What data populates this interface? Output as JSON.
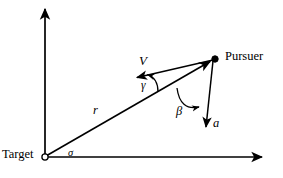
{
  "figure": {
    "background_color": "#ffffff",
    "stroke_color": "#000000",
    "width": 283,
    "height": 178
  },
  "labels": {
    "target": "Target",
    "pursuer": "Pursuer",
    "velocity": "V",
    "acceleration": "a",
    "range": "r",
    "gamma": "γ",
    "beta": "β",
    "sigma": "σ"
  },
  "diagram_data": {
    "type": "vector-diagram",
    "axes": {
      "origin": [
        45,
        157
      ],
      "x_axis_end": [
        265,
        157
      ],
      "y_axis_end": [
        45,
        6
      ],
      "arrowheads": [
        "x_axis_end",
        "y_axis_end"
      ]
    },
    "points": [
      {
        "name": "target",
        "marker": "open-circle",
        "position": [
          45,
          157
        ],
        "label": "Target"
      },
      {
        "name": "pursuer",
        "marker": "filled-dot",
        "position": [
          214,
          59
        ],
        "label": "Pursuer"
      }
    ],
    "vectors": [
      {
        "name": "range-vector-r",
        "label": "r",
        "from": [
          45,
          157
        ],
        "to": [
          214,
          59
        ],
        "arrowhead_at": "to",
        "description": "line-of-sight from Target to Pursuer"
      },
      {
        "name": "velocity-vector-V",
        "label": "V",
        "from": [
          214,
          59
        ],
        "to": [
          134,
          78
        ],
        "arrowhead_at": "to",
        "description": "pursuer velocity vector"
      },
      {
        "name": "acceleration-vector-a",
        "label": "a",
        "from": [
          214,
          59
        ],
        "to": [
          205,
          131
        ],
        "arrowhead_at": "to",
        "description": "pursuer lateral acceleration vector"
      }
    ],
    "angles": [
      {
        "name": "sigma",
        "label": "σ",
        "vertex": [
          45,
          157
        ],
        "between": [
          "x-axis",
          "range-vector-r"
        ],
        "arc": false,
        "label_position": [
          68,
          148
        ]
      },
      {
        "name": "gamma",
        "label": "γ",
        "vertex": [
          166,
          83
        ],
        "between": [
          "range-vector-r",
          "velocity-vector-V"
        ],
        "arc": true,
        "arrowhead": true,
        "label_position": [
          141,
          80
        ]
      },
      {
        "name": "beta",
        "label": "β",
        "vertex": [
          214,
          59
        ],
        "between": [
          "range-vector-r",
          "acceleration-vector-a"
        ],
        "arc": true,
        "arrowhead": true,
        "label_position": [
          176,
          105
        ]
      }
    ]
  }
}
